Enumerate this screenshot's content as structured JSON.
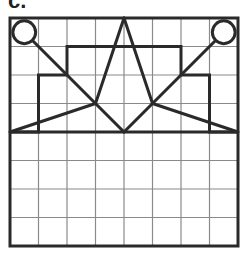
{
  "figure": {
    "label": "c.",
    "grid": {
      "cols": 8,
      "rows": 8,
      "x0": 10,
      "y0": 18,
      "cell": 28.5
    },
    "colors": {
      "grid_line": "#8a8a8a",
      "stroke": "#2a2a2a",
      "background": "#ffffff"
    },
    "shapes": {
      "circles": [
        {
          "cx": 0.5,
          "cy": 0.5,
          "r": 0.4
        },
        {
          "cx": 7.5,
          "cy": 0.5,
          "r": 0.4
        }
      ],
      "step_outline": [
        [
          0,
          4
        ],
        [
          1,
          4
        ],
        [
          1,
          2
        ],
        [
          2,
          2
        ],
        [
          2,
          1
        ],
        [
          6,
          1
        ],
        [
          6,
          2
        ],
        [
          7,
          2
        ],
        [
          7,
          4
        ],
        [
          8,
          4
        ]
      ],
      "horizontal_line": {
        "y": 4
      },
      "apex": [
        4,
        0
      ],
      "focus_left": [
        3,
        3
      ],
      "focus_right": [
        5,
        3
      ],
      "lines": [
        [
          [
            0.78,
            0.78
          ],
          [
            4,
            4
          ]
        ],
        [
          [
            7.22,
            0.78
          ],
          [
            4,
            4
          ]
        ],
        [
          [
            4,
            0
          ],
          [
            3,
            3
          ]
        ],
        [
          [
            4,
            0
          ],
          [
            5,
            3
          ]
        ],
        [
          [
            3,
            3
          ],
          [
            0,
            4
          ]
        ],
        [
          [
            5,
            3
          ],
          [
            8,
            4
          ]
        ]
      ]
    }
  }
}
